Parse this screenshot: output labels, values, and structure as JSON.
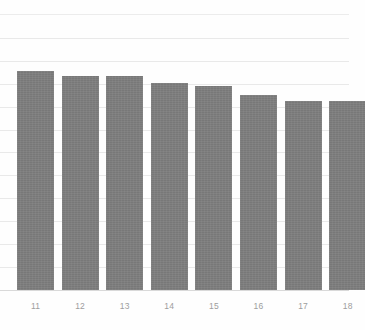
{
  "chart": {
    "background_color": "#fefefe",
    "bar_color": "#7d7d7d",
    "gridline_color": "#e9e9e9",
    "axis_color": "#d9d9d9",
    "tick_label_color": "#9d9d9d"
  },
  "chart_data": {
    "type": "bar",
    "title": "",
    "subtitle": "",
    "xlabel": "",
    "ylabel": "",
    "categories": [
      "11",
      "12",
      "13",
      "14",
      "15",
      "16",
      "17",
      "18"
    ],
    "values": [
      9.65,
      9.43,
      9.43,
      9.12,
      8.99,
      8.59,
      8.33,
      8.33
    ],
    "series": [
      {
        "name": "",
        "values": [
          9.65,
          9.43,
          9.43,
          9.12,
          8.99,
          8.59,
          8.33,
          8.33
        ]
      }
    ],
    "ylim": [
      0,
      12.15
    ],
    "xlim": [
      0,
      8
    ],
    "grid": true,
    "grid_axis": "y",
    "gridline_values": [
      12.15,
      11.1,
      10.05,
      9.0,
      8.05,
      7.05,
      6.05,
      5.05,
      4.05,
      3.0,
      2.0,
      1.0
    ],
    "legend": null,
    "legend_position": "none",
    "annotations": [],
    "tick_labels_x": [
      "11",
      "12",
      "13",
      "14",
      "15",
      "16",
      "17",
      "18"
    ],
    "tick_labels_y": []
  },
  "layout": {
    "canvas_width": 365,
    "canvas_height": 330,
    "baseline_y": 290,
    "grid_right_x": 349,
    "bar_width": 37,
    "bar_pitch": 44.6,
    "bar_first_left": 17,
    "label_y": 301,
    "gridline_y": [
      14,
      38,
      61,
      84,
      107,
      130,
      152,
      175,
      198,
      221,
      244,
      267
    ],
    "bar_top_y": [
      71,
      76,
      76,
      83,
      86,
      95,
      101,
      101
    ]
  }
}
